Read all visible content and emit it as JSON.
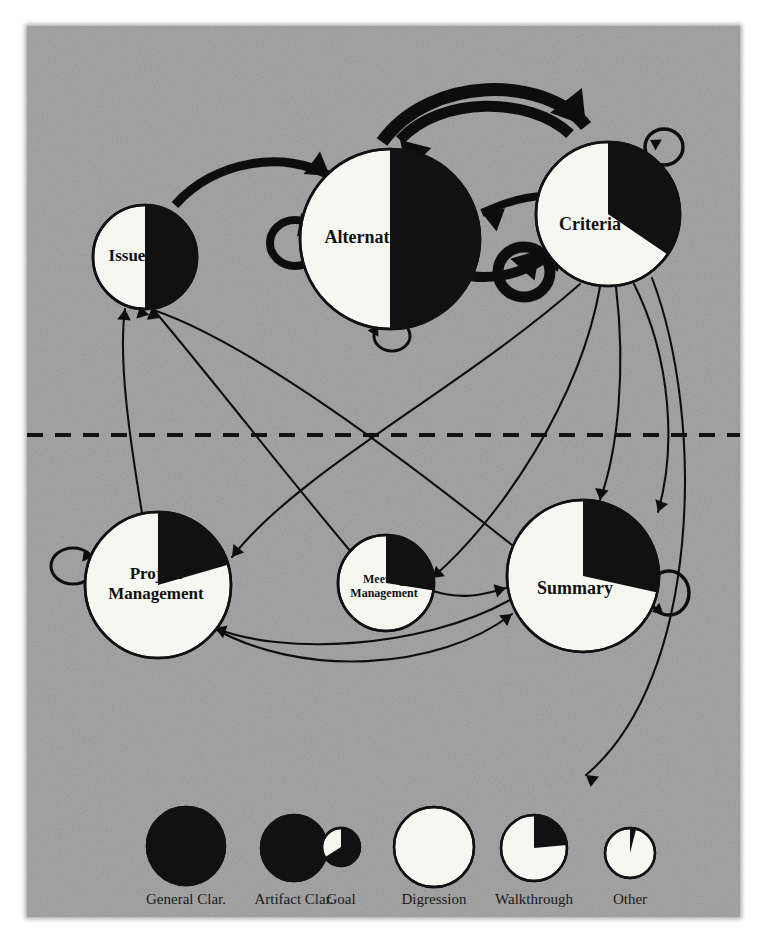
{
  "figure": {
    "panel": {
      "background_color": "#a8a8a8",
      "x": 27,
      "y": 26,
      "width": 713,
      "height": 891
    },
    "divider": {
      "label": "dashed-separator",
      "y": 435,
      "x1": 27,
      "x2": 745,
      "color": "#111111"
    },
    "ink_color": "#111111",
    "node_fill_color": "#f7f7f2",
    "node_slice_color": "#111111"
  },
  "nodes": [
    {
      "id": "issue",
      "label": "Issue",
      "cx": 145,
      "cy": 257,
      "r": 52,
      "black_fraction": 0.5,
      "start_angle": 0,
      "group": "upper",
      "label_dx": -18,
      "label_dy": 0,
      "font_size": 17
    },
    {
      "id": "alternative",
      "label": "Alternative",
      "cx": 390,
      "cy": 239,
      "r": 90,
      "black_fraction": 0.5,
      "start_angle": 0,
      "group": "upper",
      "label_dx": -22,
      "label_dy": 0,
      "font_size": 18
    },
    {
      "id": "criteria",
      "label": "Criteria",
      "cx": 608,
      "cy": 214,
      "r": 72,
      "black_fraction": 0.345,
      "start_angle": 0,
      "group": "upper",
      "label_dx": -18,
      "label_dy": 12,
      "font_size": 18
    },
    {
      "id": "project-management",
      "label": "Project\nManagement",
      "label_line1": "Project",
      "label_line2": "Management",
      "cx": 158,
      "cy": 585,
      "r": 73,
      "black_fraction": 0.205,
      "start_angle": 0,
      "group": "lower",
      "label_dx": -2,
      "label_dy": 0,
      "font_size": 17
    },
    {
      "id": "meeting-management",
      "label": "Meeting\nManagement",
      "label_line1": "Meeting",
      "label_line2": "Management",
      "cx": 386,
      "cy": 583,
      "r": 48,
      "black_fraction": 0.275,
      "start_angle": 0,
      "group": "lower",
      "label_dx": -2,
      "label_dy": 4,
      "font_size": 12
    },
    {
      "id": "summary",
      "label": "Summary",
      "cx": 583,
      "cy": 576,
      "r": 76,
      "black_fraction": 0.285,
      "start_angle": 0,
      "group": "lower",
      "label_dx": -8,
      "label_dy": 14,
      "font_size": 18
    }
  ],
  "thick_edges": [
    {
      "name": "issue-to-alternative",
      "path": "M 175 205 C 215 160, 285 150, 330 176",
      "width": 9,
      "arrow_at": "end",
      "arrow_angle": 36
    },
    {
      "name": "alternative-to-criteria-outer",
      "path": "M 382 142 C 430 75, 545 75, 586 126",
      "width": 13,
      "arrow_at": "end",
      "arrow_angle": 52
    },
    {
      "name": "criteria-to-alternative-inner",
      "path": "M 570 134 C 530 96, 440 96, 400 140",
      "width": 11,
      "arrow_at": "end",
      "arrow_angle": 226
    },
    {
      "name": "alternative-to-criteria-mid",
      "path": "M 482 213 C 510 200, 530 196, 545 196",
      "width": 8,
      "arrow_at": "start",
      "arrow_angle": 200
    },
    {
      "name": "alternative-to-criteria-lower",
      "path": "M 470 276 C 510 282, 545 262, 563 243",
      "width": 10,
      "arrow_at": "end",
      "arrow_angle": 312
    }
  ],
  "self_loops": [
    {
      "name": "alternative-self-loop-left",
      "cx": 295,
      "cy": 243,
      "rx": 25,
      "ry": 23,
      "width": 8,
      "arrow_angle": 10,
      "arrow_x": 318,
      "arrow_y": 228
    },
    {
      "name": "alternative-self-loop-bottom",
      "cx": 392,
      "cy": 336,
      "rx": 18,
      "ry": 15,
      "width": 3,
      "arrow_angle": 300,
      "arrow_x": 378,
      "arrow_y": 325
    },
    {
      "name": "criteria-self-loop-top-right",
      "cx": 664,
      "cy": 147,
      "rx": 19,
      "ry": 18,
      "width": 3.5,
      "arrow_angle": 210,
      "arrow_x": 650,
      "arrow_y": 140
    },
    {
      "name": "criteria-self-loop-bottom-left",
      "cx": 524,
      "cy": 272,
      "rx": 26,
      "ry": 25,
      "width": 11,
      "arrow_angle": 312,
      "arrow_x": 540,
      "arrow_y": 250
    },
    {
      "name": "project-management-self-loop",
      "cx": 73,
      "cy": 566,
      "rx": 22,
      "ry": 18,
      "width": 3,
      "arrow_angle": 8,
      "arrow_x": 93,
      "arrow_y": 557
    },
    {
      "name": "summary-self-loop-right",
      "cx": 669,
      "cy": 593,
      "rx": 20,
      "ry": 22,
      "width": 3.5,
      "arrow_angle": 160,
      "arrow_x": 652,
      "arrow_y": 612
    }
  ],
  "thin_edges": [
    {
      "name": "project-management-to-issue",
      "path": "M 142 513 C 130 440, 118 360, 125 309",
      "arrow_angle": 275
    },
    {
      "name": "summary-to-issue",
      "path": "M 512 545 C 380 440, 230 330, 140 306",
      "arrow_angle": 255
    },
    {
      "name": "meeting-management-to-issue",
      "path": "M 352 553 C 290 480, 205 370, 152 308",
      "arrow_angle": 262
    },
    {
      "name": "criteria-to-project-management-upper",
      "path": "M 580 284 C 460 390, 300 470, 232 557",
      "arrow_angle": 128
    },
    {
      "name": "criteria-to-meeting-management",
      "path": "M 600 287 C 580 400, 500 520, 432 578",
      "arrow_angle": 140
    },
    {
      "name": "criteria-to-summary-left",
      "path": "M 616 287 C 626 370, 618 450, 600 500",
      "arrow_angle": 100
    },
    {
      "name": "criteria-to-summary-right",
      "path": "M 634 284 C 672 360, 676 450, 658 512",
      "arrow_angle": 110
    },
    {
      "name": "criteria-to-digression-legend",
      "path": "M 652 278 C 706 420, 700 680, 586 775",
      "arrow_angle": 218
    },
    {
      "name": "project-management-to-summary",
      "path": "M 208 625 C 300 680, 440 670, 512 614",
      "arrow_angle": 323
    },
    {
      "name": "summary-to-project-management",
      "path": "M 510 600 C 420 650, 280 655, 215 628",
      "arrow_angle": 200
    },
    {
      "name": "meeting-management-to-summary",
      "path": "M 430 590 C 460 600, 480 596, 506 588",
      "arrow_angle": 345
    }
  ],
  "legend": {
    "baseline_y": 847,
    "label_y": 901,
    "items": [
      {
        "name": "general-clar",
        "label": "General Clar.",
        "cx": 186,
        "cy": 846,
        "r": 39,
        "black_fraction": 1.0
      },
      {
        "name": "artifact-clar",
        "label": "Artifact Clar.",
        "cx": 294,
        "cy": 848,
        "r": 33,
        "black_fraction": 1.0
      },
      {
        "name": "goal",
        "label": "Goal",
        "cx": 341,
        "cy": 847,
        "r": 19,
        "black_fraction": 0.66
      },
      {
        "name": "digression",
        "label": "Digression",
        "cx": 434,
        "cy": 847,
        "r": 40,
        "black_fraction": 0.0
      },
      {
        "name": "walkthrough",
        "label": "Walkthrough",
        "cx": 534,
        "cy": 848,
        "r": 33,
        "black_fraction": 0.235
      },
      {
        "name": "other",
        "label": "Other",
        "cx": 630,
        "cy": 853,
        "r": 25,
        "black_fraction": 0.04
      }
    ]
  }
}
